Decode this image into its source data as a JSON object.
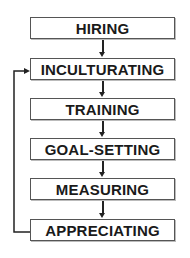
{
  "diagram": {
    "steps": [
      {
        "label": "HIRING"
      },
      {
        "label": "INCULTURATING"
      },
      {
        "label": "TRAINING"
      },
      {
        "label": "GOAL-SETTING"
      },
      {
        "label": "MEASURING"
      },
      {
        "label": "APPRECIATING"
      }
    ],
    "feedback_loop": {
      "from": "APPRECIATING",
      "to": "INCULTURATING"
    },
    "colors": {
      "line": "#222222",
      "border": "#555555",
      "text": "#1a1a1a"
    }
  }
}
